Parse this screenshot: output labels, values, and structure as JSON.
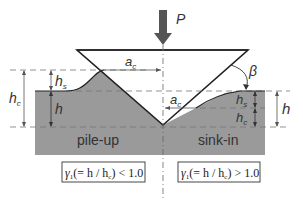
{
  "diagram": {
    "load_label": "P",
    "angle_label": "β",
    "contact_radius_label": "a",
    "contact_radius_sub": "c",
    "regions": {
      "left": "pile-up",
      "right": "sink-in"
    },
    "dimensions": {
      "hs": {
        "main": "h",
        "sub": "s"
      },
      "hc": {
        "main": "h",
        "sub": "c"
      },
      "h": "h"
    },
    "formulas": {
      "left": {
        "gamma": "γ",
        "gamma_sub": "1",
        "body": "(= h / h",
        "body_sub": "c",
        "tail": ") < 1.0"
      },
      "right": {
        "gamma": "γ",
        "gamma_sub": "1",
        "body": "(= h / h",
        "body_sub": "c",
        "tail": ") > 1.0"
      }
    },
    "colors": {
      "material": "#9a9a9a",
      "indenter_stroke": "#222222",
      "arrow": "#555555",
      "dash": "#777777"
    }
  }
}
